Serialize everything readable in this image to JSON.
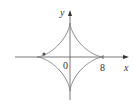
{
  "figure": {
    "colors": {
      "curve": "#7a7a7a",
      "axis": "#555555",
      "text": "#333333",
      "background": "#ffffff"
    },
    "labels": {
      "y_axis": "y",
      "x_axis": "x",
      "origin": "0",
      "x_cusp_value": "8"
    },
    "curve": {
      "type": "astroid",
      "equation": "x^(2/3) + y^(2/3) = 8^(2/3)",
      "radius": 8
    },
    "marked_point": {
      "visible": true
    }
  }
}
